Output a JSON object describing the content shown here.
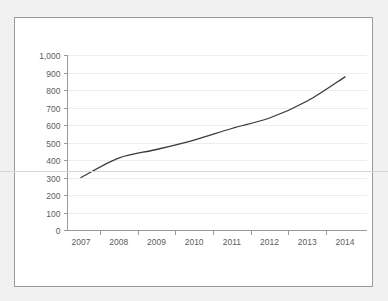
{
  "chart_data": {
    "type": "line",
    "title": "",
    "xlabel": "",
    "ylabel": "",
    "x": [
      2007,
      2008,
      2009,
      2010,
      2011,
      2012,
      2013,
      2014
    ],
    "categories": [
      "2007",
      "2008",
      "2009",
      "2010",
      "2011",
      "2012",
      "2013",
      "2014"
    ],
    "values": [
      300,
      411,
      460,
      514,
      580,
      640,
      737,
      875
    ],
    "series": [
      {
        "name": "",
        "values": [
          300,
          411,
          460,
          514,
          580,
          640,
          737,
          875
        ]
      }
    ],
    "ylim": [
      0,
      1000
    ],
    "y_ticks": [
      0,
      100,
      200,
      300,
      400,
      500,
      600,
      700,
      800,
      900,
      1000
    ],
    "y_tick_labels": [
      "0",
      "100",
      "200",
      "300",
      "400",
      "500",
      "600",
      "700",
      "800",
      "900",
      "1,000"
    ],
    "x_tick_labels": [
      "2007",
      "2008",
      "2009",
      "2010",
      "2011",
      "2012",
      "2013",
      "2014"
    ],
    "grid": true,
    "legend": "none",
    "line_color": "#3a3a3a",
    "grid_color": "#ededed",
    "axis_color": "#9a9a9a",
    "label_color": "#5d5d5d",
    "panel_background": "#ffffff",
    "page_background": "#f1f1f1"
  }
}
